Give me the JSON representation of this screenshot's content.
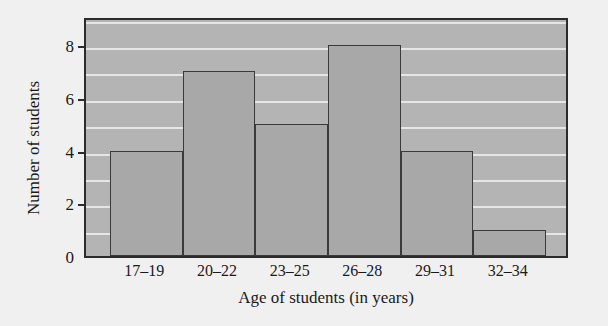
{
  "chart_data": {
    "type": "bar",
    "title": "",
    "subtitle": "",
    "xlabel": "Age of students (in years)",
    "ylabel": "Number of students",
    "categories": [
      "17–19",
      "20–22",
      "23–25",
      "26–28",
      "29–31",
      "32–34"
    ],
    "values": [
      4,
      7,
      5,
      8,
      4,
      1
    ],
    "ylim": [
      0,
      9.1
    ],
    "ytick_labels": [
      "0",
      "2",
      "4",
      "6",
      "8"
    ],
    "ytick_values": [
      0,
      2,
      4,
      6,
      8
    ],
    "gridline_values": [
      1,
      2,
      3,
      4,
      5,
      6,
      7,
      8,
      9
    ],
    "grid": true,
    "legend": null,
    "legend_position": "none",
    "colors": {
      "bar_fill": "#a8a8a8",
      "bar_edge": "#3a3a3a",
      "plot_background": "#b4b4b4",
      "gridline": "#efefef",
      "frame": "#2b2b2b",
      "page_background": "#f0f0f0",
      "text": "#1a1a1a"
    }
  }
}
